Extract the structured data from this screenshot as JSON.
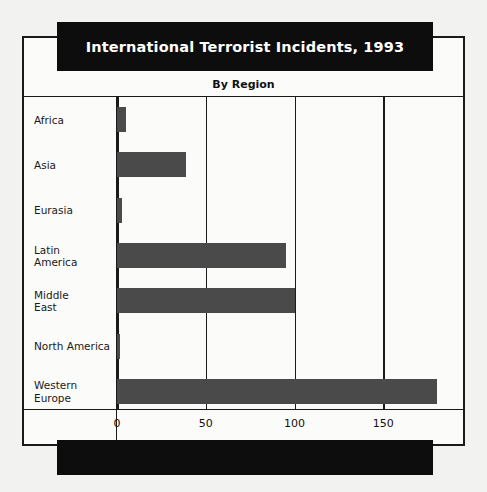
{
  "title": "International Terrorist Incidents, 1993",
  "subtitle": "By Region",
  "chart_data": {
    "type": "bar",
    "orientation": "horizontal",
    "title": "International Terrorist Incidents, 1993",
    "subtitle": "By Region",
    "xlabel": "",
    "ylabel": "",
    "categories": [
      "Africa",
      "Asia",
      "Eurasia",
      "Latin\nAmerica",
      "Middle\nEast",
      "North America",
      "Western\nEurope"
    ],
    "values": [
      5,
      39,
      3,
      95,
      100,
      1,
      180
    ],
    "xticks": [
      0,
      50,
      100,
      150
    ],
    "xtick_labels": [
      "0",
      "50",
      "100",
      "150"
    ],
    "xlim": [
      0,
      196
    ],
    "grid": true,
    "legend": null,
    "bar_color": "#4a4a4a",
    "frame_color": "#1a1a1a",
    "banner_color": "#0d0d0d",
    "background": "#fbfbfa"
  }
}
